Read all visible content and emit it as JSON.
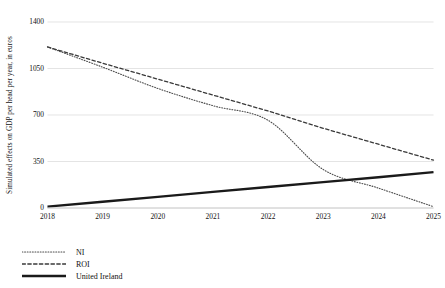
{
  "chart_data": {
    "type": "line",
    "title": "",
    "subtitle": "",
    "xlabel": "",
    "ylabel": "Simulated effects on GDP per head per year, in euros",
    "x": [
      2018,
      2019,
      2020,
      2021,
      2022,
      2023,
      2024,
      2025
    ],
    "xtick_labels": [
      "2018",
      "2019",
      "2020",
      "2021",
      "2022",
      "2023",
      "2024",
      "2025"
    ],
    "ytick_labels": [
      "1400",
      "1050",
      "700",
      "350",
      "0"
    ],
    "ytick_values": [
      1400,
      1050,
      700,
      350,
      0
    ],
    "ylim": [
      0,
      1400
    ],
    "xlim": [
      2018,
      2025
    ],
    "grid": "horizontal",
    "legend_position": "below-left",
    "series": [
      {
        "name": "NI",
        "style": "dotted",
        "color": "#4d4d4d",
        "width": 1.1,
        "values": [
          1212,
          1060,
          900,
          770,
          660,
          290,
          150,
          10
        ]
      },
      {
        "name": "ROI",
        "style": "dashed",
        "color": "#3a3a3a",
        "width": 1.3,
        "values": [
          1212,
          1090,
          970,
          850,
          730,
          600,
          480,
          360
        ]
      },
      {
        "name": "United Ireland",
        "style": "solid",
        "color": "#1a1a1a",
        "width": 2.4,
        "values": [
          10,
          47,
          84,
          121,
          158,
          195,
          232,
          270
        ]
      }
    ],
    "annotations": []
  },
  "legend": {
    "items": [
      {
        "label": "NI",
        "style": "dotted",
        "icon": "dotted-line-icon"
      },
      {
        "label": "ROI",
        "style": "dashed",
        "icon": "dashed-line-icon"
      },
      {
        "label": "United Ireland",
        "style": "solid",
        "icon": "solid-line-icon"
      }
    ]
  },
  "colors": {
    "background": "#ffffff",
    "gridline": "#d9d9d9",
    "text": "#111111",
    "ni": "#4d4d4d",
    "roi": "#3a3a3a",
    "united_ireland": "#1a1a1a"
  }
}
